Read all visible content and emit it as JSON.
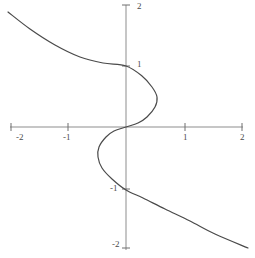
{
  "figure": {
    "name": "cartesian-plot",
    "width": 255,
    "height": 258,
    "background_color": "#ffffff"
  },
  "style": {
    "axis_color": "#8a8a8a",
    "tick_color": "#6e6e6e",
    "curve_color": "#4a4a4a",
    "label_color": "#4a4a4a",
    "axis_width": 1,
    "curve_width": 1.2
  },
  "axes": {
    "x_axis": {
      "label": "",
      "min": -2.15,
      "max": 2.05,
      "pixel_y": 127,
      "pixel_left": 10,
      "pixel_right": 243,
      "tick_values": [
        -2,
        -1,
        1,
        2
      ],
      "tick_labels": [
        "-2",
        "-1",
        "1",
        "2"
      ]
    },
    "y_axis": {
      "label": "",
      "min": -2.1,
      "max": 2.1,
      "pixel_x": 126,
      "pixel_top": 5,
      "pixel_bottom": 250,
      "tick_values": [
        2,
        1,
        -1,
        -2
      ],
      "tick_labels": [
        "2",
        "1",
        "-1",
        "-2"
      ]
    },
    "origin": {
      "x": 126,
      "y": 127
    },
    "grid": false,
    "legend": false
  },
  "labels": [
    {
      "name": "x-tick-label-neg2",
      "text": "-2",
      "left": 16,
      "top": 133
    },
    {
      "name": "x-tick-label-neg1",
      "text": "-1",
      "left": 63,
      "top": 133
    },
    {
      "name": "x-tick-label-pos1",
      "text": "1",
      "left": 183,
      "top": 133
    },
    {
      "name": "x-tick-label-pos2",
      "text": "2",
      "left": 240,
      "top": 133
    },
    {
      "name": "y-tick-label-pos2",
      "text": "2",
      "left": 137,
      "top": 2
    },
    {
      "name": "y-tick-label-pos1",
      "text": "1",
      "left": 137,
      "top": 60
    },
    {
      "name": "y-tick-label-neg1",
      "text": "-1",
      "left": 110,
      "top": 184
    },
    {
      "name": "y-tick-label-neg2",
      "text": "-2",
      "left": 112,
      "top": 240
    }
  ],
  "chart_data": {
    "type": "line",
    "title": "",
    "subtitle": "",
    "xlabel": "",
    "ylabel": "",
    "xlim": [
      -2.15,
      2.05
    ],
    "ylim": [
      -2.1,
      2.1
    ],
    "xticks": [
      -2,
      -1,
      1,
      2
    ],
    "yticks": [
      -2,
      -1,
      1,
      2
    ],
    "grid": false,
    "legend_position": "none",
    "series": [
      {
        "name": "cubic-curve",
        "color": "#4a4a4a",
        "parametrized_by": "y",
        "y": [
          2.05,
          1.9,
          1.8,
          1.7,
          1.6,
          1.5,
          1.4,
          1.3,
          1.2,
          1.1,
          1.0,
          0.9,
          0.8,
          0.7,
          0.6,
          0.5,
          0.4,
          0.3,
          0.2,
          0.1,
          0.0,
          -0.1,
          -0.2,
          -0.3,
          -0.4,
          -0.5,
          -0.6,
          -0.7,
          -0.8,
          -0.9,
          -1.0,
          -1.1,
          -1.2,
          -1.3,
          -1.4,
          -1.5,
          -1.6,
          -1.7,
          -1.8,
          -1.9,
          -2.05
        ],
        "x": [
          -2.0,
          -1.53,
          -1.25,
          -1.0,
          -0.78,
          -0.58,
          -0.4,
          -0.24,
          -0.11,
          0.0,
          0.0,
          0.1,
          0.16,
          0.21,
          0.23,
          0.24,
          0.23,
          0.2,
          0.15,
          0.08,
          0.0,
          -0.08,
          -0.15,
          -0.2,
          -0.23,
          -0.24,
          -0.23,
          -0.21,
          -0.16,
          -0.1,
          0.0,
          0.0,
          0.11,
          0.24,
          0.4,
          0.58,
          0.78,
          1.0,
          1.25,
          1.53,
          2.0
        ],
        "anchor_points_pixels": [
          [
            8,
            12
          ],
          [
            30,
            29
          ],
          [
            55,
            45
          ],
          [
            80,
            57
          ],
          [
            103,
            63
          ],
          [
            126,
            66
          ],
          [
            142,
            76
          ],
          [
            152,
            87
          ],
          [
            157,
            97
          ],
          [
            155,
            107
          ],
          [
            147,
            117
          ],
          [
            138,
            123
          ],
          [
            126,
            127
          ],
          [
            114,
            131
          ],
          [
            106,
            137
          ],
          [
            99,
            147
          ],
          [
            98,
            157
          ],
          [
            102,
            168
          ],
          [
            112,
            179
          ],
          [
            126,
            190
          ],
          [
            143,
            198
          ],
          [
            165,
            209
          ],
          [
            190,
            221
          ],
          [
            215,
            234
          ],
          [
            248,
            248
          ]
        ]
      }
    ]
  },
  "ticks": {
    "x_pixels": [
      11,
      68,
      185,
      242
    ],
    "y_pixels": [
      5,
      66,
      189,
      248
    ],
    "half_length": 4
  }
}
